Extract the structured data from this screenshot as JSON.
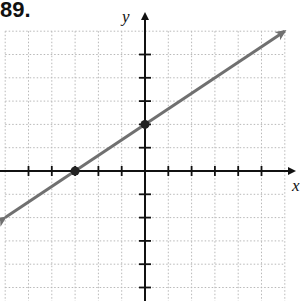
{
  "problem": {
    "number": "89."
  },
  "axes": {
    "x_label": "x",
    "y_label": "y"
  },
  "colors": {
    "grid": "#b8b8b8",
    "axis": "#111111",
    "line": "#707070",
    "points": "#222222"
  },
  "chart_data": {
    "type": "line",
    "title": "89.",
    "xlabel": "x",
    "ylabel": "y",
    "xlim": [
      -6,
      6
    ],
    "ylim": [
      -5,
      6
    ],
    "grid": true,
    "tick_spacing": 1,
    "tick_labels": [],
    "series": [
      {
        "name": "line",
        "equation": "y = (2/3)x + 2",
        "slope": 0.6667,
        "intercept": 2,
        "x": [
          -6,
          -3,
          0,
          6
        ],
        "y": [
          -2,
          0,
          2,
          6
        ],
        "arrows": "both"
      }
    ],
    "marked_points": [
      {
        "label": "x-intercept",
        "x": -3,
        "y": 0
      },
      {
        "label": "y-intercept",
        "x": 0,
        "y": 2
      }
    ]
  }
}
